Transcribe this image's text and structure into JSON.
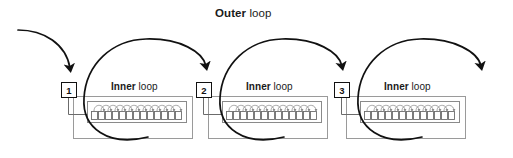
{
  "diagram": {
    "type": "nested-loop-process-diagram",
    "canvas": {
      "width": 513,
      "height": 158,
      "background": "#ffffff"
    },
    "colors": {
      "outer_arrow": "#111111",
      "inner_arc": "#8c8c8c",
      "cell_border": "#6e6e6e",
      "group_box_border": "#9a9a9a",
      "inner_box_border": "#8a8a8a",
      "number_box_border": "#111111",
      "connector": "#6b6b6b",
      "text": "#1a1a1a"
    },
    "outer_loop": {
      "title_bold": "Outer",
      "title_rest": " loop",
      "title_full": "Outer loop",
      "arrow_count": 4,
      "arrow_direction": "down"
    },
    "groups": [
      {
        "number": "1",
        "inner_title_bold": "Inner",
        "inner_title_rest": " loop",
        "inner_title_full": "Inner loop",
        "cell_count": 13
      },
      {
        "number": "2",
        "inner_title_bold": "Inner",
        "inner_title_rest": " loop",
        "inner_title_full": "Inner loop",
        "cell_count": 13
      },
      {
        "number": "3",
        "inner_title_bold": "Inner",
        "inner_title_rest": " loop",
        "inner_title_full": "Inner loop",
        "cell_count": 13
      }
    ]
  }
}
